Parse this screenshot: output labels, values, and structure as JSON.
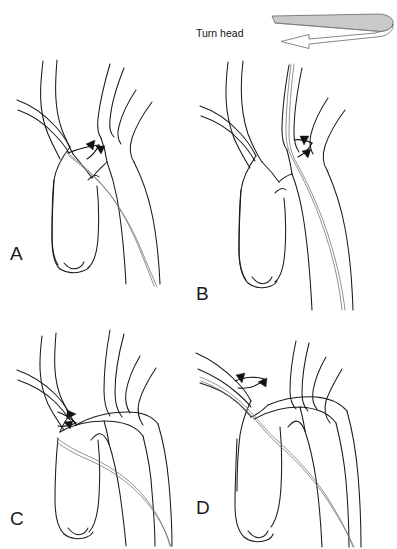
{
  "figure": {
    "type": "medical-line-illustration",
    "width": 397,
    "height": 549,
    "background_color": "#ffffff",
    "line_color": "#1a1a1a",
    "catheter_color": "#6e6e6e",
    "arrow_color": "#111111"
  },
  "annotation": {
    "turn_head_label": "Turn head",
    "arrow_fill_top": "#c9c9c9",
    "arrow_fill_bottom": "#ffffff",
    "arrow_stroke": "#555555"
  },
  "panels": [
    {
      "id": "A",
      "label": "A",
      "label_x": 10,
      "label_y": 243,
      "description": "Catheter tip in aortic arch directed toward left common carotid origin",
      "has_direction_arrow": true
    },
    {
      "id": "B",
      "label": "B",
      "label_x": 196,
      "label_y": 283,
      "description": "Catheter advanced up the left common carotid artery",
      "has_direction_arrow": true
    },
    {
      "id": "C",
      "label": "C",
      "label_x": 10,
      "label_y": 508,
      "description": "Catheter looped through arch toward innominate / brachiocephalic origin",
      "has_direction_arrow": true
    },
    {
      "id": "D",
      "label": "D",
      "label_x": 196,
      "label_y": 497,
      "description": "Catheter advanced into the innominate and right subclavian artery",
      "has_direction_arrow": true
    }
  ]
}
